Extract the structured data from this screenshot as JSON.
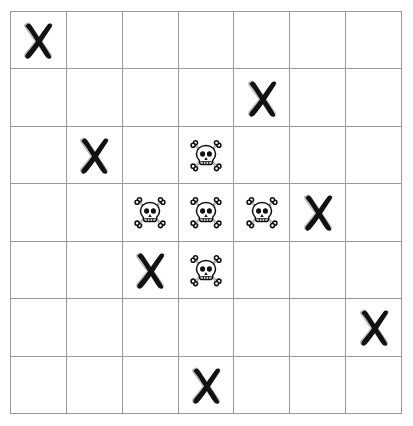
{
  "board": {
    "rows": 7,
    "columns": 7,
    "background_color": "#ffffff",
    "grid_line_color": "#9a9a9a",
    "mark_color": "#111111",
    "icons": {
      "cross": "cross-mark-icon",
      "skull": "skull-and-crossbones-icon",
      "empty": "empty-cell"
    },
    "cells": [
      [
        "cross",
        "empty",
        "empty",
        "empty",
        "empty",
        "empty",
        "empty"
      ],
      [
        "empty",
        "empty",
        "empty",
        "empty",
        "cross",
        "empty",
        "empty"
      ],
      [
        "empty",
        "cross",
        "empty",
        "skull",
        "empty",
        "empty",
        "empty"
      ],
      [
        "empty",
        "empty",
        "skull",
        "skull",
        "skull",
        "cross",
        "empty"
      ],
      [
        "empty",
        "empty",
        "cross",
        "skull",
        "empty",
        "empty",
        "empty"
      ],
      [
        "empty",
        "empty",
        "empty",
        "empty",
        "empty",
        "empty",
        "cross"
      ],
      [
        "empty",
        "empty",
        "empty",
        "cross",
        "empty",
        "empty",
        "empty"
      ]
    ],
    "counts": {
      "cross": 7,
      "skull": 5,
      "empty": 37
    }
  }
}
